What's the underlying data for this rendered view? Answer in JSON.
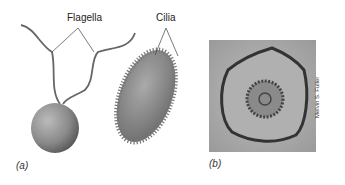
{
  "labels": {
    "flagella": "Flagella",
    "cilia": "Cilia"
  },
  "panels": {
    "a": "(a)",
    "b": "(b)"
  },
  "credit": "Melvin S. Fuller",
  "icons": {
    "flagellated_cell": "flagellated-cell-illustration",
    "ciliated_cell": "ciliated-cell-illustration",
    "micrograph": "axoneme-cross-section-micrograph"
  }
}
